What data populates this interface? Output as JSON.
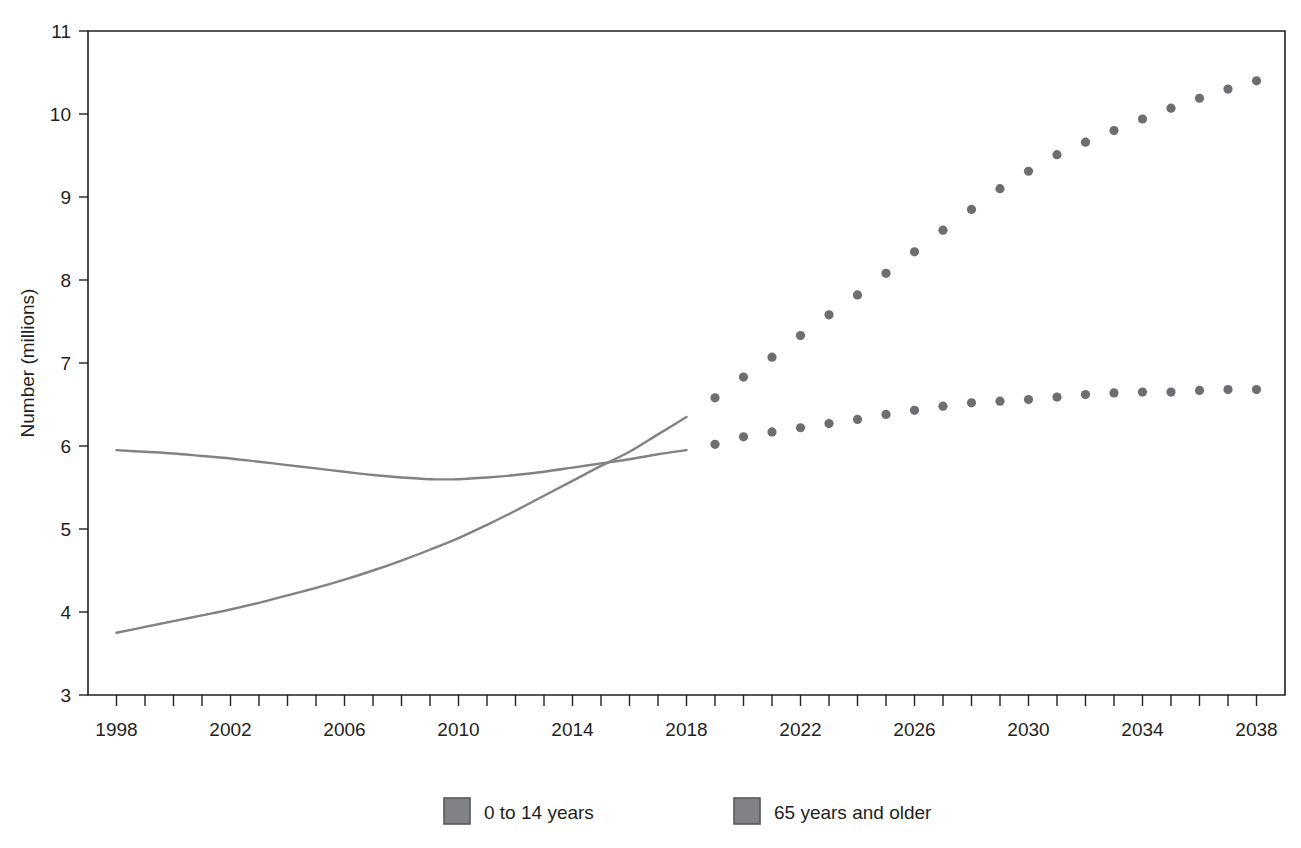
{
  "chart_data": {
    "type": "line",
    "title": "",
    "xlabel": "",
    "ylabel": "Number (millions)",
    "xlim": [
      1998,
      2038
    ],
    "ylim": [
      3,
      11
    ],
    "grid": false,
    "legend_position": "bottom",
    "y_ticks": [
      "3",
      "4",
      "5",
      "6",
      "7",
      "8",
      "9",
      "10",
      "11"
    ],
    "x_ticks_labeled": [
      "1998",
      "2002",
      "2006",
      "2010",
      "2014",
      "2018",
      "2022",
      "2026",
      "2030",
      "2034",
      "2038"
    ],
    "x_tick_step_minor": 1,
    "x_tick_step_major": 4,
    "series": [
      {
        "name": "0 to 14 years",
        "style": "solid",
        "segment": "historical",
        "color": "#808285",
        "x": [
          1998,
          1999,
          2000,
          2001,
          2002,
          2003,
          2004,
          2005,
          2006,
          2007,
          2008,
          2009,
          2010,
          2011,
          2012,
          2013,
          2014,
          2015,
          2016,
          2017,
          2018
        ],
        "values": [
          5.95,
          5.93,
          5.91,
          5.88,
          5.85,
          5.81,
          5.77,
          5.73,
          5.69,
          5.65,
          5.62,
          5.6,
          5.6,
          5.62,
          5.65,
          5.69,
          5.74,
          5.79,
          5.84,
          5.9,
          5.95
        ]
      },
      {
        "name": "65 years and older",
        "style": "solid",
        "segment": "historical",
        "color": "#808285",
        "x": [
          1998,
          1999,
          2000,
          2001,
          2002,
          2003,
          2004,
          2005,
          2006,
          2007,
          2008,
          2009,
          2010,
          2011,
          2012,
          2013,
          2014,
          2015,
          2016,
          2017,
          2018
        ],
        "values": [
          3.75,
          3.82,
          3.89,
          3.96,
          4.03,
          4.11,
          4.2,
          4.29,
          4.39,
          4.5,
          4.62,
          4.75,
          4.89,
          5.05,
          5.22,
          5.4,
          5.58,
          5.76,
          5.93,
          6.14,
          6.35
        ]
      },
      {
        "name": "0 to 14 years",
        "style": "dotted",
        "segment": "projection",
        "color": "#6d6e71",
        "x": [
          2019,
          2020,
          2021,
          2022,
          2023,
          2024,
          2025,
          2026,
          2027,
          2028,
          2029,
          2030,
          2031,
          2032,
          2033,
          2034,
          2035,
          2036,
          2037,
          2038
        ],
        "values": [
          6.02,
          6.11,
          6.17,
          6.22,
          6.27,
          6.32,
          6.38,
          6.43,
          6.48,
          6.52,
          6.54,
          6.56,
          6.59,
          6.62,
          6.64,
          6.65,
          6.65,
          6.67,
          6.68,
          6.68
        ]
      },
      {
        "name": "65 years and older",
        "style": "dotted",
        "segment": "projection",
        "color": "#6d6e71",
        "x": [
          2019,
          2020,
          2021,
          2022,
          2023,
          2024,
          2025,
          2026,
          2027,
          2028,
          2029,
          2030,
          2031,
          2032,
          2033,
          2034,
          2035,
          2036,
          2037,
          2038
        ],
        "values": [
          6.58,
          6.83,
          7.07,
          7.33,
          7.58,
          7.82,
          8.08,
          8.34,
          8.6,
          8.85,
          9.1,
          9.31,
          9.51,
          9.66,
          9.8,
          9.94,
          10.07,
          10.19,
          10.3,
          10.4
        ]
      }
    ]
  },
  "legend": {
    "items": [
      {
        "label": "0 to 14 years",
        "color": "#808285"
      },
      {
        "label": "65 years and older",
        "color": "#808285"
      }
    ]
  },
  "colors": {
    "line": "#808285",
    "dot": "#6d6e71",
    "axis": "#231f20",
    "background": "#ffffff"
  }
}
